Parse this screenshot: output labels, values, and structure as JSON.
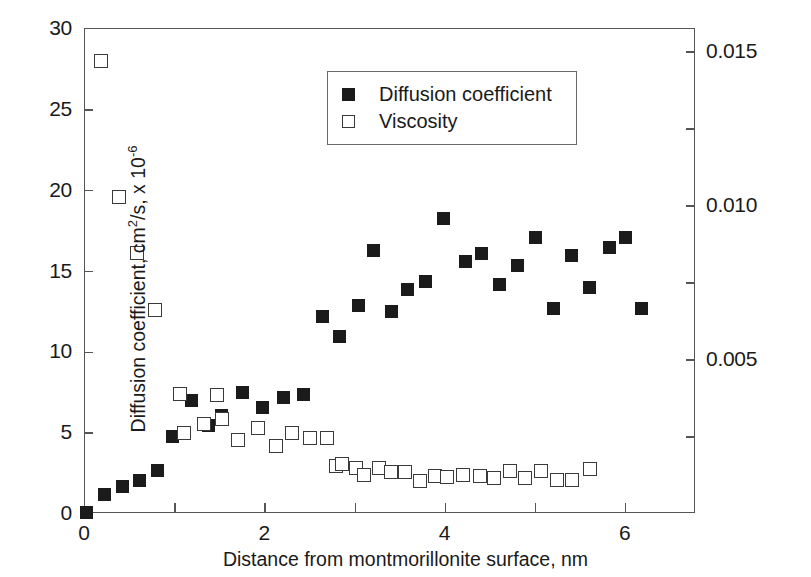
{
  "figure": {
    "background": "#ffffff",
    "marker_fill_color": "#1b1b1b",
    "marker_open_color": "#3a3a3a",
    "axis_color": "#555555"
  },
  "legend": {
    "position": "top-center",
    "items": [
      {
        "label": "Diffusion coefficient",
        "marker": "filled-square-icon"
      },
      {
        "label": "Viscosity",
        "marker": "open-square-icon"
      }
    ]
  },
  "axes": {
    "x": {
      "label": "Distance from montmorillonite surface, nm",
      "min": 0,
      "max": 6.78,
      "major_ticks": [
        0,
        2,
        4,
        6
      ],
      "minor_ticks": [
        1,
        3,
        5
      ],
      "tick_labels": [
        "0",
        "2",
        "4",
        "6"
      ]
    },
    "y_left": {
      "label_prefix": "Diffusion coefficient, cm",
      "label_sup1": "2",
      "label_mid": "/s, x 10",
      "label_sup2": "-6",
      "label_full": "Diffusion coefficient, cm2/s, x 10-6",
      "min": 0,
      "max": 30,
      "major_ticks": [
        0,
        5,
        10,
        15,
        20,
        25,
        30
      ],
      "tick_labels": [
        "0",
        "5",
        "10",
        "15",
        "20",
        "25",
        "30"
      ]
    },
    "y_right": {
      "label": "Viscosity, Pa.s",
      "min": 0,
      "max": 0.01575,
      "major_ticks": [
        0.005,
        0.01,
        0.015
      ],
      "minor_ticks": [
        0.0025,
        0.0075,
        0.0125
      ],
      "tick_labels": [
        "0.005",
        "0.010",
        "0.015"
      ]
    }
  },
  "chart_data": {
    "type": "scatter",
    "title": "",
    "xlabel": "Distance from montmorillonite surface, nm",
    "ylabel": "Diffusion coefficient, cm2/s, x 10-6",
    "ylabel_right": "Viscosity, Pa.s",
    "xlim": [
      0,
      6.78
    ],
    "ylim": [
      0,
      30
    ],
    "ylim_right": [
      0,
      0.01575
    ],
    "grid": false,
    "legend_position": "top-center",
    "series": [
      {
        "name": "Diffusion coefficient",
        "axis": "left",
        "marker": "filled-square",
        "color": "#1b1b1b",
        "points": [
          [
            0.02,
            0.1
          ],
          [
            0.22,
            1.2
          ],
          [
            0.42,
            1.7
          ],
          [
            0.6,
            2.1
          ],
          [
            0.8,
            2.7
          ],
          [
            0.97,
            4.8
          ],
          [
            1.18,
            7.0
          ],
          [
            1.37,
            5.5
          ],
          [
            1.52,
            6.1
          ],
          [
            1.75,
            7.5
          ],
          [
            1.97,
            6.6
          ],
          [
            2.2,
            7.2
          ],
          [
            2.42,
            7.4
          ],
          [
            2.63,
            12.2
          ],
          [
            2.82,
            11.0
          ],
          [
            3.04,
            12.9
          ],
          [
            3.2,
            16.3
          ],
          [
            3.4,
            12.5
          ],
          [
            3.58,
            13.9
          ],
          [
            3.78,
            14.4
          ],
          [
            3.98,
            18.3
          ],
          [
            4.22,
            15.6
          ],
          [
            4.4,
            16.1
          ],
          [
            4.6,
            14.2
          ],
          [
            4.8,
            15.4
          ],
          [
            5.0,
            17.1
          ],
          [
            5.2,
            12.7
          ],
          [
            5.4,
            16.0
          ],
          [
            5.6,
            14.0
          ],
          [
            5.82,
            16.5
          ],
          [
            6.0,
            17.1
          ],
          [
            6.18,
            12.7
          ]
        ]
      },
      {
        "name": "Viscosity",
        "axis": "right",
        "marker": "open-square",
        "color": "#3a3a3a",
        "points": [
          [
            0.18,
            0.0147
          ],
          [
            0.38,
            0.01028
          ],
          [
            0.58,
            0.00848
          ],
          [
            0.78,
            0.00662
          ],
          [
            1.05,
            0.0039
          ],
          [
            1.1,
            0.00262
          ],
          [
            1.32,
            0.00292
          ],
          [
            1.46,
            0.00385
          ],
          [
            1.52,
            0.0031
          ],
          [
            1.7,
            0.0024
          ],
          [
            1.92,
            0.00278
          ],
          [
            2.12,
            0.00222
          ],
          [
            2.3,
            0.00262
          ],
          [
            2.5,
            0.00248
          ],
          [
            2.68,
            0.00248
          ],
          [
            2.79,
            0.00156
          ],
          [
            2.85,
            0.00162
          ],
          [
            3.01,
            0.0015
          ],
          [
            3.1,
            0.00126
          ],
          [
            3.26,
            0.00148
          ],
          [
            3.4,
            0.00138
          ],
          [
            3.55,
            0.00136
          ],
          [
            3.72,
            0.00108
          ],
          [
            3.88,
            0.00122
          ],
          [
            4.02,
            0.0012
          ],
          [
            4.2,
            0.00126
          ],
          [
            4.38,
            0.00124
          ],
          [
            4.54,
            0.00116
          ],
          [
            4.72,
            0.0014
          ],
          [
            4.88,
            0.00118
          ],
          [
            5.06,
            0.0014
          ],
          [
            5.24,
            0.00112
          ],
          [
            5.4,
            0.00112
          ],
          [
            5.6,
            0.00146
          ]
        ]
      }
    ]
  }
}
